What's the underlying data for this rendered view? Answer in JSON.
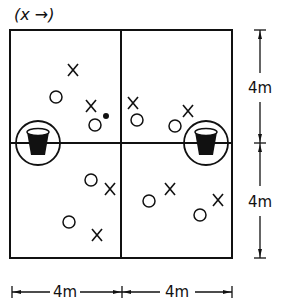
{
  "title": "(x →)",
  "colors": {
    "ink": "#111111",
    "background": "#ffffff"
  },
  "court": {
    "quadrants": 4,
    "width_label": "4m",
    "height_label": "4m"
  },
  "dimensions": {
    "bottom": [
      "4m",
      "4m"
    ],
    "right": [
      "4m",
      "4m"
    ]
  },
  "legend_symbols": {
    "player": "X",
    "opponent": "O",
    "ball": "dot",
    "basket": "basket-in-circle"
  },
  "baskets": [
    {
      "id": "left",
      "cx": 38,
      "cy": 143
    },
    {
      "id": "right",
      "cx": 206,
      "cy": 143
    }
  ],
  "players_x": [
    {
      "x": 73,
      "y": 70
    },
    {
      "x": 91,
      "y": 106
    },
    {
      "x": 133,
      "y": 103
    },
    {
      "x": 188,
      "y": 111
    },
    {
      "x": 110,
      "y": 189
    },
    {
      "x": 97,
      "y": 235
    },
    {
      "x": 170,
      "y": 189
    },
    {
      "x": 218,
      "y": 200
    }
  ],
  "players_o": [
    {
      "x": 56,
      "y": 97
    },
    {
      "x": 95,
      "y": 125
    },
    {
      "x": 137,
      "y": 120
    },
    {
      "x": 175,
      "y": 126
    },
    {
      "x": 91,
      "y": 180
    },
    {
      "x": 69,
      "y": 222
    },
    {
      "x": 149,
      "y": 201
    },
    {
      "x": 200,
      "y": 215
    }
  ],
  "ball": {
    "x": 106,
    "y": 116
  }
}
